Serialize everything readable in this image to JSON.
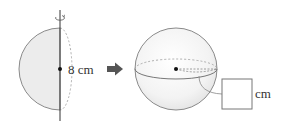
{
  "diagram": {
    "type": "rotation-solid-of-revolution",
    "left_figure": {
      "shape": "semicircle",
      "fill": "#ececec",
      "stroke": "#8a8a8a",
      "axis_color": "#333333",
      "rotation_icon": "rotation-arrow-icon",
      "diameter_label": "8 cm"
    },
    "arrow": {
      "icon": "right-arrow-icon",
      "color": "#555555"
    },
    "right_figure": {
      "shape": "sphere",
      "fill": "#f7f7f7",
      "stroke": "#8a8a8a",
      "radius_answer_box": "",
      "unit_label": "cm"
    }
  }
}
